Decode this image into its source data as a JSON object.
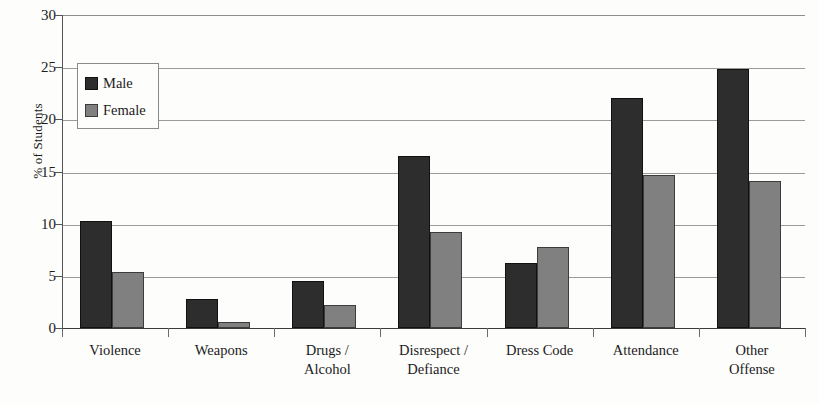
{
  "chart_data": {
    "type": "bar",
    "title": "",
    "xlabel": "",
    "ylabel": "% of Students",
    "ylim": [
      0,
      30
    ],
    "yticks": [
      0,
      5,
      10,
      15,
      20,
      25,
      30
    ],
    "ytick_labels": [
      "0",
      "5",
      "10",
      "15",
      "20",
      "25",
      "30"
    ],
    "grid": true,
    "legend_position": "upper-left-inside",
    "categories": [
      "Violence",
      "Weapons",
      "Drugs / Alcohol",
      "Disrespect / Defiance",
      "Dress Code",
      "Attendance",
      "Other Offense"
    ],
    "category_lines": [
      [
        "Violence",
        ""
      ],
      [
        "Weapons",
        ""
      ],
      [
        "Drugs /",
        "Alcohol"
      ],
      [
        "Disrespect /",
        "Defiance"
      ],
      [
        "Dress Code",
        ""
      ],
      [
        "Attendance",
        ""
      ],
      [
        "Other",
        "Offense"
      ]
    ],
    "series": [
      {
        "name": "Male",
        "color": "#2d2d2d",
        "values": [
          10.3,
          2.8,
          4.5,
          16.5,
          6.2,
          22.0,
          24.8
        ]
      },
      {
        "name": "Female",
        "color": "#808080",
        "values": [
          5.4,
          0.6,
          2.2,
          9.2,
          7.8,
          14.7,
          14.1
        ]
      }
    ]
  },
  "legend": {
    "items": [
      {
        "label": "Male",
        "swatch": "male-swatch"
      },
      {
        "label": "Female",
        "swatch": "female-swatch"
      }
    ]
  },
  "colors": {
    "male": "#2d2d2d",
    "female": "#808080",
    "background": "#fdfdfc",
    "axis": "#3a3a3a",
    "gridline": "#9a9a9a"
  }
}
